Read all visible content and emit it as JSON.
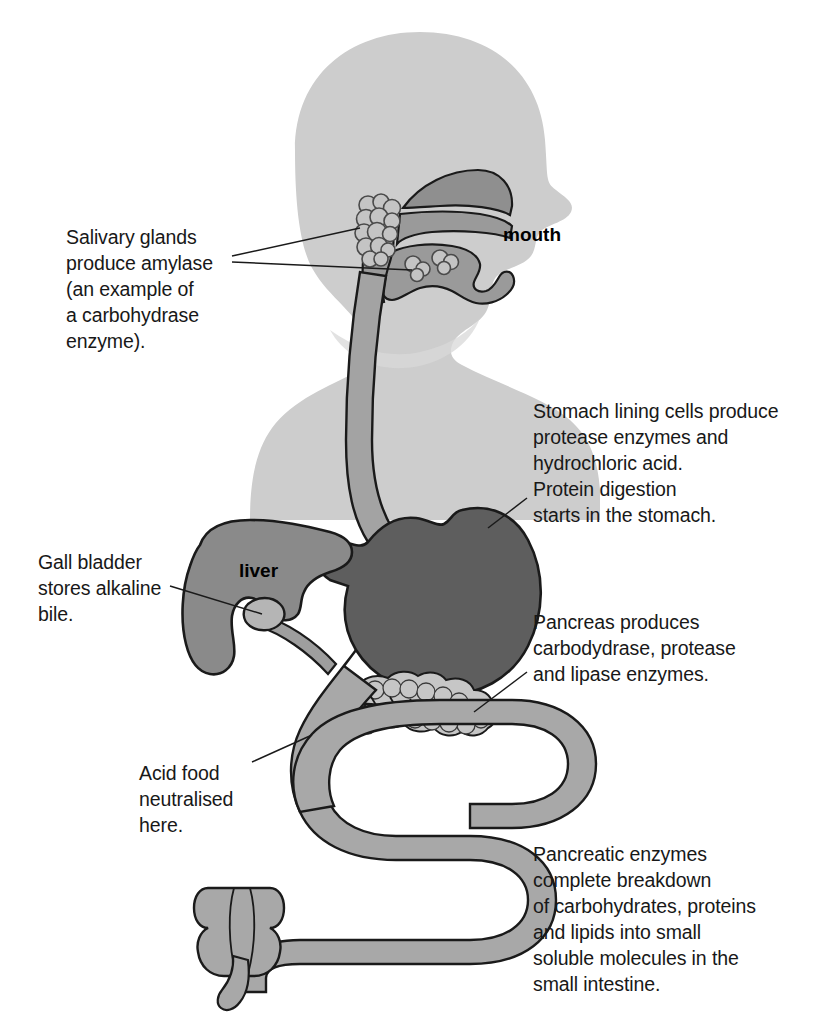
{
  "diagram": {
    "background_color": "#ffffff",
    "colors": {
      "body_silhouette": "#cdcdcd",
      "oral_structures": "#9a9a9a",
      "oesophagus": "#a3a3a3",
      "stomach": "#5e5e5e",
      "liver": "#8a8a8a",
      "gall_bladder": "#b5b5b5",
      "pancreas": "#c6c6c6",
      "intestine": "#a8a8a8",
      "outline": "#1a1a1a",
      "text": "#181818"
    }
  },
  "organ_labels": [
    {
      "id": "mouth",
      "text": "mouth"
    },
    {
      "id": "liver",
      "text": "liver"
    }
  ],
  "annotations": [
    {
      "id": "salivary",
      "text": "Salivary glands\nproduce amylase\n(an example of\na carbohydrase\nenzyme).",
      "points_to": "salivary-glands"
    },
    {
      "id": "stomach",
      "text": "Stomach lining cells produce\nprotease enzymes and\nhydrochloric acid.\nProtein digestion\nstarts in the stomach.",
      "points_to": "stomach"
    },
    {
      "id": "gall_bladder",
      "text": "Gall bladder\nstores alkaline\nbile.",
      "points_to": "gall-bladder"
    },
    {
      "id": "pancreas",
      "text": "Pancreas produces\ncarbodydrase, protease\nand lipase enzymes.",
      "points_to": "pancreas"
    },
    {
      "id": "acid_food",
      "text": "Acid food\nneutralised\nhere.",
      "points_to": "duodenum"
    },
    {
      "id": "pancreatic_enzymes",
      "text": "Pancreatic enzymes\ncomplete breakdown\nof carbohydrates, proteins\nand lipids into small\nsoluble molecules in the\nsmall intestine.",
      "points_to": "small-intestine"
    }
  ]
}
